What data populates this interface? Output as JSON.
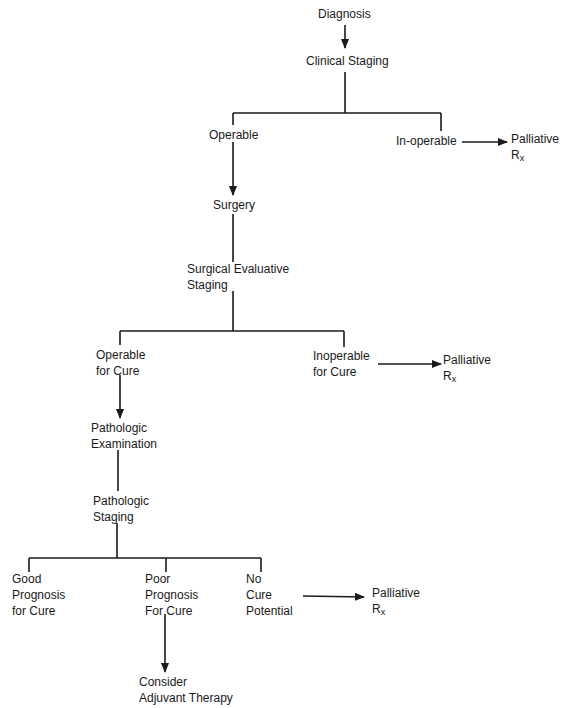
{
  "diagram": {
    "type": "flowchart",
    "colors": {
      "line": "#1a1a1a",
      "background": "#ffffff"
    },
    "nodes": {
      "diagnosis": {
        "lines": [
          "Diagnosis"
        ]
      },
      "clinical_staging": {
        "lines": [
          "Clinical Staging"
        ]
      },
      "operable": {
        "lines": [
          "Operable"
        ]
      },
      "inoperable": {
        "lines": [
          "In-operable"
        ]
      },
      "palliative_1": {
        "lines": [
          "Palliative",
          "R",
          "x"
        ]
      },
      "surgery": {
        "lines": [
          "Surgery"
        ]
      },
      "surgical_evaluative_staging": {
        "lines": [
          "Surgical Evaluative",
          "Staging"
        ]
      },
      "operable_for_cure": {
        "lines": [
          "Operable",
          "for Cure"
        ]
      },
      "inoperable_for_cure": {
        "lines": [
          "Inoperable",
          "for Cure"
        ]
      },
      "palliative_2": {
        "lines": [
          "Palliative",
          "R",
          "x"
        ]
      },
      "pathologic_examination": {
        "lines": [
          "Pathologic",
          "Examination"
        ]
      },
      "pathologic_staging": {
        "lines": [
          "Pathologic",
          "Staging"
        ]
      },
      "good_prognosis": {
        "lines": [
          "Good",
          "Prognosis",
          "for Cure"
        ]
      },
      "poor_prognosis": {
        "lines": [
          "Poor",
          "Prognosis",
          "For Cure"
        ]
      },
      "no_cure_potential": {
        "lines": [
          "No",
          "Cure",
          "Potential"
        ]
      },
      "palliative_3": {
        "lines": [
          "Palliative",
          "R",
          "x"
        ]
      },
      "adjuvant_therapy": {
        "lines": [
          "Consider",
          "Adjuvant Therapy"
        ]
      }
    },
    "edges": [
      [
        "diagnosis",
        "clinical_staging",
        "arrow"
      ],
      [
        "clinical_staging",
        "operable",
        "line"
      ],
      [
        "clinical_staging",
        "inoperable",
        "line"
      ],
      [
        "inoperable",
        "palliative_1",
        "arrow"
      ],
      [
        "operable",
        "surgery",
        "arrow"
      ],
      [
        "surgery",
        "surgical_evaluative_staging",
        "line"
      ],
      [
        "surgical_evaluative_staging",
        "operable_for_cure",
        "line"
      ],
      [
        "surgical_evaluative_staging",
        "inoperable_for_cure",
        "line"
      ],
      [
        "inoperable_for_cure",
        "palliative_2",
        "arrow"
      ],
      [
        "operable_for_cure",
        "pathologic_examination",
        "arrow"
      ],
      [
        "pathologic_examination",
        "pathologic_staging",
        "line"
      ],
      [
        "pathologic_staging",
        "good_prognosis",
        "line"
      ],
      [
        "pathologic_staging",
        "poor_prognosis",
        "line"
      ],
      [
        "pathologic_staging",
        "no_cure_potential",
        "line"
      ],
      [
        "no_cure_potential",
        "palliative_3",
        "arrow"
      ],
      [
        "poor_prognosis",
        "adjuvant_therapy",
        "arrow"
      ]
    ]
  }
}
